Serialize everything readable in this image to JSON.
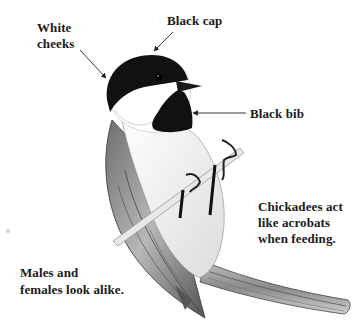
{
  "diagram": {
    "labels": {
      "white_cheeks": [
        "White",
        "cheeks"
      ],
      "black_cap": "Black cap",
      "black_bib": "Black bib"
    },
    "captions": {
      "acrobats": [
        "Chickadees act",
        "like acrobats",
        "when feeding."
      ],
      "alike": [
        "Males and",
        "females look alike."
      ]
    },
    "colors": {
      "background": "#ffffff",
      "text": "#1a1a1a",
      "cap_and_bib": "#111111",
      "wing_gray": "#8a8a8a"
    }
  }
}
